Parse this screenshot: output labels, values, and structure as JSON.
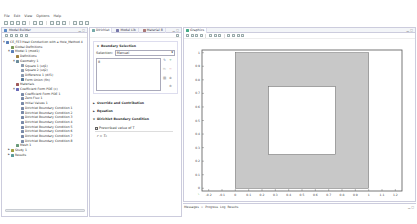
{
  "menubar": {
    "items": [
      "File",
      "Edit",
      "View",
      "Options",
      "Help"
    ]
  },
  "toolbar": {
    "buttons": [
      "new-icon",
      "open-icon",
      "save-icon",
      "print-icon",
      "undo-icon",
      "redo-icon",
      "copy-icon",
      "paste-icon",
      "delete-icon",
      "model-wizard-icon",
      "select-icon",
      "zoom-icon"
    ]
  },
  "left_panel": {
    "title": "Model Builder",
    "tree": [
      {
        "indent": 0,
        "twisty": "▲",
        "icon": "model-icon",
        "label": "CE_FE3 Heat Conduction with a Hole_Method 4"
      },
      {
        "indent": 1,
        "twisty": "",
        "icon": "global-icon",
        "label": "Global Definitions"
      },
      {
        "indent": 1,
        "twisty": "▲",
        "icon": "component-icon",
        "label": "Model 1 (mod1)"
      },
      {
        "indent": 2,
        "twisty": "",
        "icon": "definitions-icon",
        "label": "Definitions"
      },
      {
        "indent": 2,
        "twisty": "▲",
        "icon": "geometry-icon",
        "label": "Geometry 1"
      },
      {
        "indent": 3,
        "twisty": "",
        "icon": "square-icon",
        "label": "Square 1 (sq1)"
      },
      {
        "indent": 3,
        "twisty": "",
        "icon": "square-icon",
        "label": "Square 2 (sq2)"
      },
      {
        "indent": 3,
        "twisty": "",
        "icon": "difference-icon",
        "label": "Difference 1 (dif1)"
      },
      {
        "indent": 3,
        "twisty": "",
        "icon": "form-union-icon",
        "label": "Form Union (fin)"
      },
      {
        "indent": 2,
        "twisty": "",
        "icon": "materials-icon",
        "label": "Materials"
      },
      {
        "indent": 2,
        "twisty": "▲",
        "icon": "pde-icon",
        "label": "Coefficient Form PDE (c)"
      },
      {
        "indent": 3,
        "twisty": "",
        "icon": "node-icon",
        "label": "Coefficient Form PDE 1"
      },
      {
        "indent": 3,
        "twisty": "",
        "icon": "node-icon",
        "label": "Zero Flux 1"
      },
      {
        "indent": 3,
        "twisty": "",
        "icon": "node-icon",
        "label": "Initial Values 1"
      },
      {
        "indent": 3,
        "twisty": "",
        "icon": "node-icon",
        "label": "Dirichlet Boundary Condition 1"
      },
      {
        "indent": 3,
        "twisty": "",
        "icon": "node-icon",
        "label": "Dirichlet Boundary Condition 2"
      },
      {
        "indent": 3,
        "twisty": "",
        "icon": "node-icon",
        "label": "Dirichlet Boundary Condition 3"
      },
      {
        "indent": 3,
        "twisty": "",
        "icon": "node-icon",
        "label": "Dirichlet Boundary Condition 4"
      },
      {
        "indent": 3,
        "twisty": "",
        "icon": "node-icon",
        "label": "Dirichlet Boundary Condition 5"
      },
      {
        "indent": 3,
        "twisty": "",
        "icon": "node-icon",
        "label": "Dirichlet Boundary Condition 6"
      },
      {
        "indent": 3,
        "twisty": "",
        "icon": "node-icon",
        "label": "Dirichlet Boundary Condition 7"
      },
      {
        "indent": 3,
        "twisty": "",
        "icon": "node-icon",
        "label": "Dirichlet Boundary Condition 8"
      },
      {
        "indent": 2,
        "twisty": "",
        "icon": "mesh-icon",
        "label": "Mesh 1"
      },
      {
        "indent": 1,
        "twisty": "▶",
        "icon": "study-icon",
        "label": "Study 1"
      },
      {
        "indent": 1,
        "twisty": "▶",
        "icon": "results-icon",
        "label": "Results"
      }
    ]
  },
  "mid_panel": {
    "tabs": [
      "Dirichlet",
      "Model Lib",
      "Material B"
    ],
    "section_title": "Boundary Selection",
    "selection_label": "Selection:",
    "selection_value": "Manual",
    "selection_list": [
      "8"
    ],
    "sections": [
      "Override and Contribution",
      "Equation",
      "Dirichlet Boundary Condition"
    ],
    "checkbox_label": "Prescribed value of T",
    "value_label": "r = T₀"
  },
  "graphics": {
    "title": "Graphics",
    "toolbar_buttons": [
      "zoom-in-icon",
      "zoom-out-icon",
      "zoom-box-icon",
      "zoom-extents-icon",
      "select-icon",
      "pan-icon",
      "rotate-icon",
      "render-icon",
      "transparency-icon",
      "screenshot-icon",
      "print-icon"
    ]
  },
  "chart_data": {
    "type": "diagram",
    "title": "",
    "xlabel": "",
    "ylabel": "",
    "x_ticks": [
      "-0.2",
      "-0.1",
      "0",
      "0.1",
      "0.2",
      "0.3",
      "0.4",
      "0.5",
      "0.6",
      "0.7",
      "0.8",
      "0.9",
      "1",
      "1.1",
      "1.2"
    ],
    "y_ticks": [
      "0",
      "0.1",
      "0.2",
      "0.3",
      "0.4",
      "0.5",
      "0.6",
      "0.7",
      "0.8",
      "0.9",
      "1"
    ],
    "shapes": [
      {
        "name": "outer square",
        "x0": 0,
        "y0": 0,
        "x1": 1,
        "y1": 1,
        "fill": "#c8c8c8"
      },
      {
        "name": "inner hole",
        "x0": 0.25,
        "y0": 0.25,
        "x1": 0.75,
        "y1": 0.75,
        "fill": "#ffffff"
      }
    ]
  },
  "bottom_tabs": [
    "Messages",
    "Progress",
    "Log",
    "Results"
  ]
}
